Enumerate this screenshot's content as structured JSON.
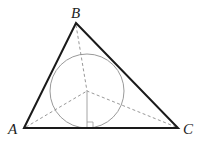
{
  "diagram": {
    "vertices": {
      "A": {
        "label": "A",
        "x": 24,
        "y": 128
      },
      "B": {
        "label": "B",
        "x": 76,
        "y": 23
      },
      "C": {
        "label": "C",
        "x": 178,
        "y": 128
      }
    },
    "incenter": {
      "x": 87,
      "y": 91
    },
    "incircle_radius": 37,
    "colors": {
      "triangle": "#1a1a1a",
      "circle": "#9a9a9a",
      "dashed": "#8c8c8c",
      "perpendicular": "#9a9a9a",
      "label": "#222222"
    }
  }
}
